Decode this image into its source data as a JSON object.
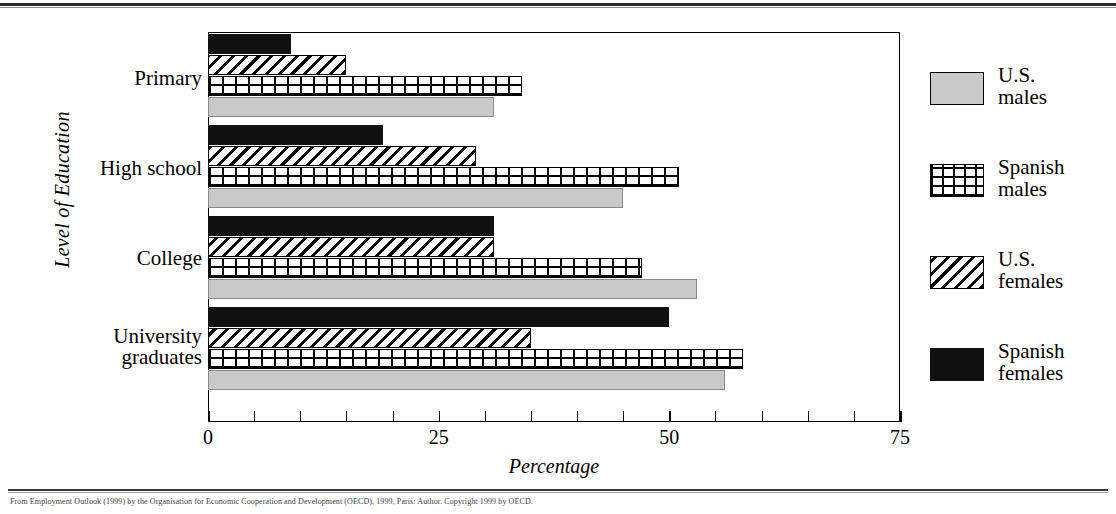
{
  "chart_data": {
    "type": "bar",
    "orientation": "horizontal",
    "title": "",
    "xlabel": "Percentage",
    "ylabel": "Level of Education",
    "xlim": [
      0,
      75
    ],
    "xticks": [
      0,
      25,
      50,
      75
    ],
    "xtick_labels": [
      "0",
      "25",
      "50",
      "75"
    ],
    "minor_tick_step": 5,
    "grid": false,
    "legend_position": "right",
    "categories": [
      "Primary",
      "High school",
      "College",
      "University graduates"
    ],
    "series": [
      {
        "name": "U.S. males",
        "pattern": "solid-gray",
        "color": "#c9c9c9",
        "values": [
          31,
          45,
          53,
          56
        ]
      },
      {
        "name": "Spanish males",
        "pattern": "grid",
        "color": "#ffffff",
        "values": [
          34,
          51,
          47,
          58
        ]
      },
      {
        "name": "U.S. females",
        "pattern": "diagonal-hatch",
        "color": "#ffffff",
        "values": [
          15,
          29,
          31,
          35
        ]
      },
      {
        "name": "Spanish females",
        "pattern": "solid-black",
        "color": "#111111",
        "values": [
          9,
          19,
          31,
          50
        ]
      }
    ]
  },
  "axis": {
    "y_title": "Level of Education",
    "x_title": "Percentage",
    "x_tick_labels": [
      "0",
      "25",
      "50",
      "75"
    ]
  },
  "categories": [
    {
      "label": "Primary"
    },
    {
      "label": "High school"
    },
    {
      "label": "College"
    },
    {
      "label": "University\ngraduates"
    }
  ],
  "legend": {
    "items": [
      {
        "label": "U.S.\nmales",
        "swatch": "gray-swatch"
      },
      {
        "label": "Spanish\nmales",
        "swatch": "grid-swatch"
      },
      {
        "label": "U.S.\nfemales",
        "swatch": "hatch-swatch"
      },
      {
        "label": "Spanish\nfemales",
        "swatch": "black-swatch"
      }
    ]
  },
  "caption": {
    "text": "From Employment Outlook (1999) by the Organisation for Economic Cooperation and Development (OECD), 1999, Paris: Author. Copyright 1999 by OECD."
  }
}
